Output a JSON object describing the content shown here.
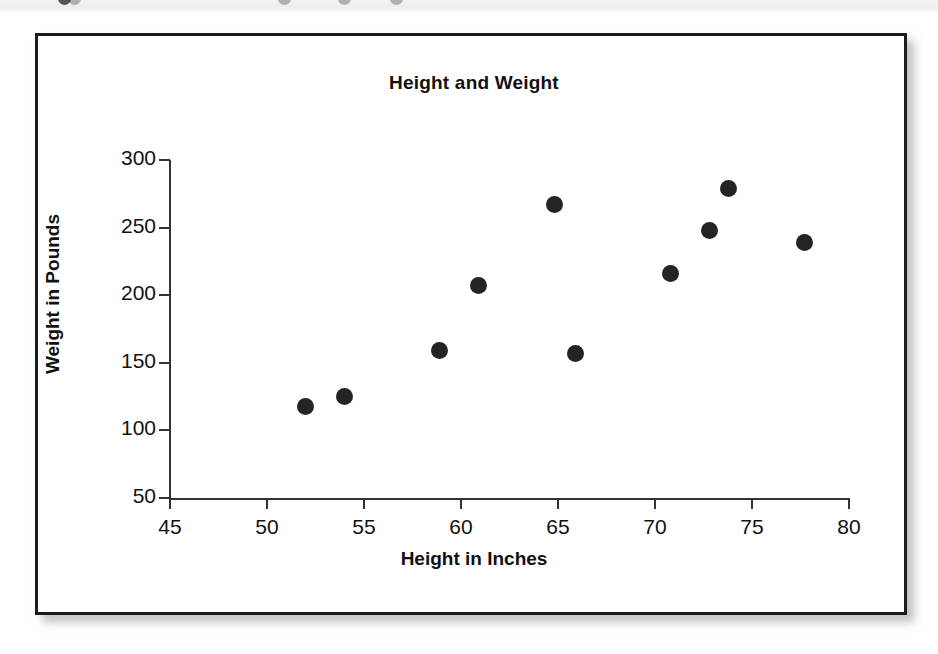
{
  "figure": {
    "frame_color": "#1c1c1c",
    "background": "#ffffff",
    "marker_color": "#242424"
  },
  "artifact": {
    "description": "scan-edge-band"
  },
  "chart_data": {
    "type": "scatter",
    "title": "Height and Weight",
    "xlabel": "Height in Inches",
    "ylabel": "Weight in Pounds",
    "xlim": [
      45,
      80
    ],
    "ylim": [
      50,
      300
    ],
    "xticks": [
      45,
      50,
      55,
      60,
      65,
      70,
      75,
      80
    ],
    "yticks": [
      50,
      100,
      150,
      200,
      250,
      300
    ],
    "grid": false,
    "legend": null,
    "series": [
      {
        "name": "observations",
        "marker": "filled-circle",
        "color": "#242424",
        "points": [
          {
            "x": 52,
            "y": 118
          },
          {
            "x": 54,
            "y": 125
          },
          {
            "x": 58.9,
            "y": 159
          },
          {
            "x": 60.9,
            "y": 207
          },
          {
            "x": 64.8,
            "y": 267
          },
          {
            "x": 65.9,
            "y": 157
          },
          {
            "x": 70.8,
            "y": 216
          },
          {
            "x": 72.8,
            "y": 248
          },
          {
            "x": 73.8,
            "y": 279
          },
          {
            "x": 77.7,
            "y": 239
          }
        ]
      }
    ]
  }
}
